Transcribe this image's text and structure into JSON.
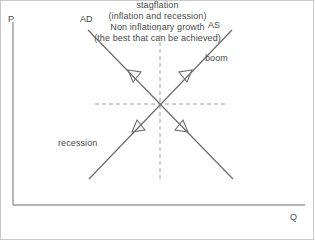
{
  "diagram": {
    "axes": {
      "y_label": "P",
      "x_label": "Q",
      "axis_color": "#9a9a9a"
    },
    "curves": [
      {
        "name": "AD",
        "label": "AD",
        "description": "aggregate demand, downward sloping",
        "color": "#6b6b6b"
      },
      {
        "name": "AS",
        "label": "AS",
        "description": "aggregate supply, upward sloping",
        "color": "#6b6b6b"
      }
    ],
    "quadrant_labels": {
      "top_left_line1": "stagflation",
      "top_left_line2": "(inflation and recession)",
      "top_right": "boom",
      "bottom_left": "recession",
      "bottom_right_line1": "Non inflationary growth",
      "bottom_right_line2": "(the best that can be achieved)"
    },
    "guides": {
      "horizontal": "dashed equilibrium price line",
      "vertical": "dashed equilibrium output line",
      "color": "#a0a0a0"
    },
    "arrow_count": 4,
    "arrow_style": "open triangle outline"
  }
}
